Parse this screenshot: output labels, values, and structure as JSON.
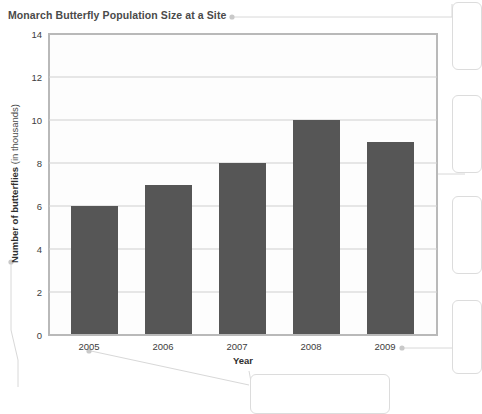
{
  "chart_data": {
    "type": "bar",
    "title": "Monarch Butterfly Population Size at a Site",
    "xlabel": "Year",
    "ylabel_strong": "Number of butterflies",
    "ylabel_light": " (in thousands)",
    "ylabel_full": "Number of butterflies (in thousands)",
    "categories": [
      "2005",
      "2006",
      "2007",
      "2008",
      "2009"
    ],
    "values": [
      6,
      7,
      8,
      10,
      9
    ],
    "ylim": [
      0,
      14
    ],
    "ytick_step": 2,
    "yticks": [
      "14",
      "12",
      "10",
      "8",
      "6",
      "4",
      "2",
      "0"
    ],
    "grid": true,
    "grid_axis": "y",
    "legend": null,
    "legend_position": "none",
    "bar_color": "#565656",
    "units": "thousands of butterflies",
    "series": [
      {
        "name": "Number of butterflies (in thousands)",
        "values": [
          6,
          7,
          8,
          10,
          9
        ]
      }
    ],
    "annotations": [
      {
        "name": "title-callout",
        "anchor": "title",
        "label": ""
      },
      {
        "name": "y-axis-label-callout",
        "anchor": "ylabel",
        "label": ""
      },
      {
        "name": "x-tick-2005-callout",
        "anchor": "2005",
        "label": ""
      },
      {
        "name": "x-tick-2009-callout",
        "anchor": "2009",
        "label": ""
      },
      {
        "name": "bar-2009-callout",
        "anchor": "2009-bar",
        "label": ""
      }
    ]
  },
  "colors": {
    "bar": "#565656",
    "frame": "#b9b9b9",
    "grid": "#cfcfcf",
    "text": "#3d3d3d",
    "leader": "#d2d2d2",
    "background": "#ffffff"
  }
}
